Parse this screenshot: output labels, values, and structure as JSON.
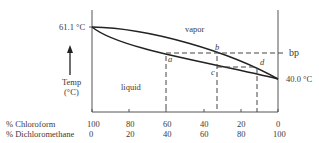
{
  "diagram": {
    "type": "boiling-point-composition diagram",
    "regions": {
      "upper": "vapor",
      "lower": "liquid"
    },
    "left_temp_label": "61.1 °C",
    "right_temp_label": "40.0 °C",
    "bp_label": "bp",
    "y_axis": {
      "label": "Temp",
      "unit": "(°C)"
    },
    "points": [
      "a",
      "b",
      "c",
      "d"
    ],
    "x_axis": {
      "rows": [
        {
          "label": "% Chloroform",
          "ticks": [
            "100",
            "80",
            "60",
            "40",
            "20",
            "0"
          ]
        },
        {
          "label": "% Dichloromethane",
          "ticks": [
            "0",
            "20",
            "40",
            "60",
            "80",
            "100"
          ]
        }
      ]
    }
  }
}
